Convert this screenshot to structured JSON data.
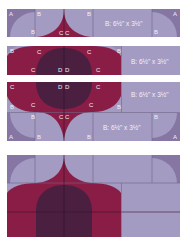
{
  "colors": {
    "lavender": "#a39bc2",
    "lavender_dark": "#978eb6",
    "corner": "#8576a3",
    "crimson": "#8a1d45",
    "plum": "#4b1f40",
    "seam": "#6f6688",
    "label": "#f2eef8"
  },
  "strips": [
    {
      "name": "top-row",
      "labels": [
        "A",
        "B",
        "B",
        "B",
        "C",
        "C",
        "B",
        "A"
      ],
      "size_label": "B: 6½\" x 3½\""
    },
    {
      "name": "middle-row",
      "labels": [
        "B",
        "C",
        "C",
        "B",
        "C",
        "D",
        "D",
        "C"
      ],
      "size_label": "B: 6½\" x 3½\""
    },
    {
      "name": "bottom-rows",
      "labels_upper": [
        "C",
        "D",
        "D",
        "C",
        "B",
        "C",
        "B",
        "C"
      ],
      "labels_lower": [
        "B",
        "B",
        "C",
        "C",
        "B",
        "A",
        "B",
        "B",
        "A"
      ],
      "size_labels": [
        "B: 6½\" x 3½\"",
        "B: 6½\" x 3½\""
      ]
    }
  ],
  "assembled_block": {
    "name": "finished-block"
  }
}
